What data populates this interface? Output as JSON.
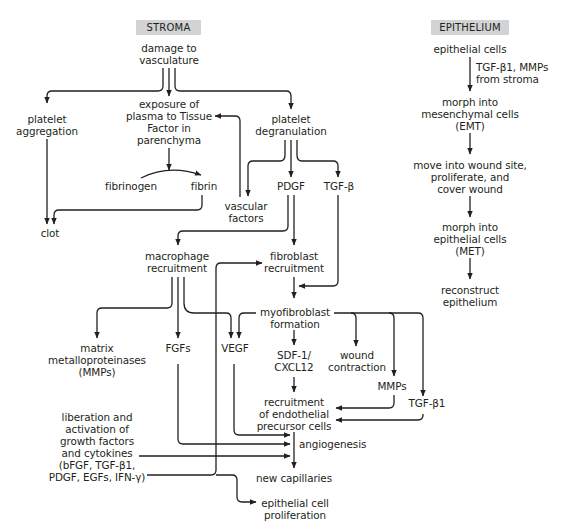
{
  "headers": {
    "stroma": "STROMA",
    "epithelium": "EPITHELIUM"
  },
  "stroma": {
    "damage": "damage to\nvasculature",
    "platelet_aggregation": "platelet\naggregation",
    "exposure": "exposure of\nplasma to Tissue\nFactor in\nparenchyma",
    "platelet_degranulation": "platelet\ndegranulation",
    "fibrinogen": "fibrinogen",
    "fibrin": "fibrin",
    "vascular_factors": "vascular\nfactors",
    "pdgf": "PDGF",
    "tgf_beta": "TGF-β",
    "clot": "clot",
    "macrophage_recruitment": "macrophage\nrecruitment",
    "fibroblast_recruitment": "fibroblast\nrecruitment",
    "myofibroblast_formation": "myofibroblast\nformation",
    "mmps_full": "matrix\nmetalloproteinases\n(MMPs)",
    "fgfs": "FGFs",
    "vegf": "VEGF",
    "sdf1": "SDF-1/\nCXCL12",
    "wound_contraction": "wound\ncontraction",
    "mmps": "MMPs",
    "tgf_beta1": "TGF-β1",
    "recruitment_endothelial": "recruitment\nof endothelial\nprecursor cells",
    "liberation": "liberation and\nactivation of\ngrowth factors\nand cytokines\n(bFGF, TGF-β1,\nPDGF, EGFs, IFN-γ)",
    "angiogenesis": "angiogenesis",
    "new_capillaries": "new capillaries",
    "epithelial_proliferation": "epithelial cell\nproliferation"
  },
  "epithelium": {
    "epithelial_cells": "epithelial cells",
    "signal": "TGF-β1, MMPs\nfrom stroma",
    "emt": "morph into\nmesenchymal cells\n(EMT)",
    "move": "move into wound site,\nproliferate, and\ncover wound",
    "met": "morph into\nepithelial cells\n(MET)",
    "reconstruct": "reconstruct\nepithelium"
  }
}
